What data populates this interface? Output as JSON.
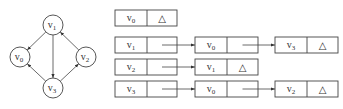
{
  "graph": {
    "vertices": [
      {
        "id": "v0",
        "base": "v",
        "sub": "0",
        "cx": 20,
        "cy": 57
      },
      {
        "id": "v1",
        "base": "v",
        "sub": "1",
        "cx": 53,
        "cy": 25
      },
      {
        "id": "v2",
        "base": "v",
        "sub": "2",
        "cx": 86,
        "cy": 57
      },
      {
        "id": "v3",
        "base": "v",
        "sub": "3",
        "cx": 53,
        "cy": 88
      }
    ],
    "edges": [
      {
        "from": "v1",
        "to": "v0"
      },
      {
        "from": "v1",
        "to": "v3"
      },
      {
        "from": "v2",
        "to": "v1"
      },
      {
        "from": "v3",
        "to": "v0"
      },
      {
        "from": "v3",
        "to": "v2"
      }
    ]
  },
  "adjacency_list": {
    "null_symbol": "△",
    "rows": [
      {
        "head": {
          "base": "v",
          "sub": "0"
        },
        "nodes": []
      },
      {
        "head": {
          "base": "v",
          "sub": "1"
        },
        "nodes": [
          {
            "base": "v",
            "sub": "0"
          },
          {
            "base": "v",
            "sub": "3"
          }
        ]
      },
      {
        "head": {
          "base": "v",
          "sub": "2"
        },
        "nodes": [
          {
            "base": "v",
            "sub": "1"
          }
        ]
      },
      {
        "head": {
          "base": "v",
          "sub": "3"
        },
        "nodes": [
          {
            "base": "v",
            "sub": "0"
          },
          {
            "base": "v",
            "sub": "2"
          }
        ]
      }
    ]
  },
  "colors": {
    "stroke": "#444444",
    "text": "#333333",
    "background": "#ffffff"
  }
}
